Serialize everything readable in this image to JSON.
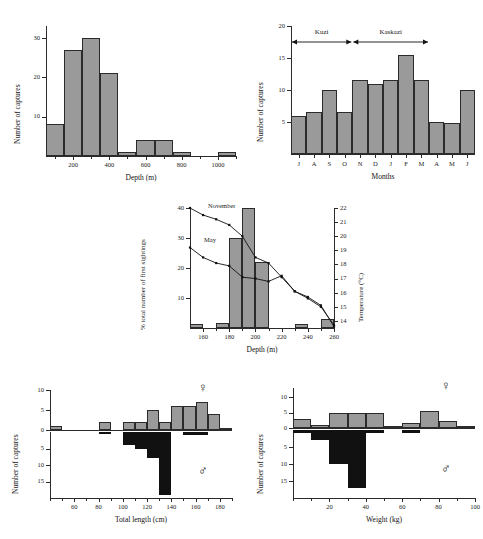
{
  "figure": {
    "panels": [
      "depth-histogram",
      "monthly-captures",
      "first-sightings-temperature",
      "total-length-by-sex",
      "weight-by-sex"
    ],
    "bar_fill": "#9a9a9a",
    "bar_dark_fill": "#111111",
    "axis_color": "#2b2b2b"
  },
  "symbols": {
    "female": "♀",
    "male": "♂"
  },
  "chart_data": [
    {
      "id": "depth-histogram",
      "type": "bar",
      "title": "",
      "xlabel": "Depth (m)",
      "ylabel": "Number of captures",
      "xlim": [
        50,
        1100
      ],
      "ylim": [
        0,
        33
      ],
      "xticks": [
        200,
        400,
        600,
        800,
        1000
      ],
      "xtick_labels": [
        "200",
        "400",
        "600",
        "800",
        "1000"
      ],
      "yticks": [
        10,
        20,
        30
      ],
      "ytick_labels": [
        "10",
        "20",
        "30"
      ],
      "bin_width": 100,
      "bin_starts": [
        50,
        150,
        250,
        350,
        450,
        550,
        650,
        750,
        1000
      ],
      "categories": [
        "50-150",
        "150-250",
        "250-350",
        "350-450",
        "450-550",
        "550-650",
        "650-750",
        "750-850",
        "1000-1100"
      ],
      "values": [
        8,
        27,
        30,
        21,
        1,
        4,
        4,
        1,
        1
      ],
      "grid": false
    },
    {
      "id": "monthly-captures",
      "type": "bar",
      "title": "",
      "xlabel": "Months",
      "ylabel": "Number of captures",
      "categories": [
        "J",
        "A",
        "S",
        "O",
        "N",
        "D",
        "J",
        "F",
        "M",
        "A",
        "M",
        "J"
      ],
      "values": [
        6,
        6.5,
        10,
        6.5,
        11.5,
        11,
        11.5,
        15.5,
        11.5,
        5,
        4.9,
        10
      ],
      "ylim": [
        0,
        20
      ],
      "yticks": [
        5,
        10,
        15,
        20
      ],
      "ytick_labels": [
        "5",
        "10",
        "15",
        "20"
      ],
      "annotations": [
        {
          "label": "Kuzi",
          "from_index": 0,
          "to_index": 3
        },
        {
          "label": "Kaskazi",
          "from_index": 4,
          "to_index": 8
        }
      ],
      "grid": false
    },
    {
      "id": "first-sightings-temperature",
      "type": "bar",
      "xlabel": "Depth (m)",
      "ylabel": "% total number of first sightings",
      "y2label": "Temperature (°C)",
      "xlim": [
        150,
        260
      ],
      "ylim": [
        0,
        40
      ],
      "y2lim": [
        13.5,
        22
      ],
      "xticks": [
        160,
        180,
        200,
        220,
        240,
        260
      ],
      "xtick_labels": [
        "160",
        "180",
        "200",
        "220",
        "240",
        "260"
      ],
      "yticks": [
        10,
        20,
        30,
        40
      ],
      "ytick_labels": [
        "10",
        "20",
        "30",
        "40"
      ],
      "y2ticks": [
        14,
        15,
        16,
        17,
        18,
        19,
        20,
        21,
        22
      ],
      "y2tick_labels": [
        "14",
        "15",
        "16",
        "17",
        "18",
        "19",
        "20",
        "21",
        "22"
      ],
      "bin_width": 10,
      "bin_starts": [
        150,
        170,
        180,
        190,
        200,
        230,
        250
      ],
      "values": [
        1.5,
        1.8,
        30,
        40,
        22,
        1.5,
        3
      ],
      "series": [
        {
          "name": "November",
          "axis": "y2",
          "x": [
            150,
            160,
            170,
            180,
            190,
            200,
            210,
            220,
            230,
            240,
            250,
            260
          ],
          "values": [
            22,
            21.5,
            21.2,
            20.8,
            20,
            18.5,
            18.1,
            17.1,
            16.1,
            15.6,
            15.0,
            13.7
          ]
        },
        {
          "name": "May",
          "axis": "y2",
          "x": [
            150,
            160,
            170,
            180,
            190,
            200,
            210,
            220,
            230,
            240,
            250,
            260
          ],
          "values": [
            19.2,
            18.5,
            18.1,
            17.9,
            17.1,
            17.0,
            16.8,
            17.2,
            16.1,
            15.7,
            15.1,
            13.6
          ]
        }
      ],
      "grid": false
    },
    {
      "id": "total-length-by-sex",
      "type": "bar",
      "xlabel": "Total length (cm)",
      "ylabel": "Number of captures",
      "xlim": [
        40,
        190
      ],
      "xticks": [
        60,
        80,
        100,
        120,
        140,
        160,
        180
      ],
      "xtick_labels": [
        "60",
        "80",
        "100",
        "120",
        "140",
        "160",
        "180"
      ],
      "bin_width": 10,
      "female": {
        "symbol": "♀",
        "ylim": [
          0,
          10
        ],
        "yticks": [
          0,
          5,
          10
        ],
        "ytick_labels": [
          "0",
          "5",
          "10"
        ],
        "bin_starts": [
          40,
          80,
          100,
          110,
          120,
          130,
          140,
          150,
          160,
          170,
          180
        ],
        "values": [
          1,
          2,
          2,
          2,
          5,
          2,
          6,
          6,
          7,
          4,
          0.6
        ]
      },
      "male": {
        "symbol": "♂",
        "ylim": [
          0,
          20
        ],
        "yticks": [
          5,
          10,
          15
        ],
        "ytick_labels": [
          "5",
          "10",
          "15"
        ],
        "bin_starts": [
          80,
          100,
          110,
          120,
          130,
          150,
          160
        ],
        "values": [
          0.5,
          4,
          5,
          8,
          19,
          1,
          1
        ]
      },
      "grid": false
    },
    {
      "id": "weight-by-sex",
      "type": "bar",
      "xlabel": "Weight (kg)",
      "ylabel": "Number of captures",
      "xlim": [
        0,
        100
      ],
      "xticks": [
        20,
        40,
        60,
        80,
        100
      ],
      "xtick_labels": [
        "20",
        "40",
        "60",
        "80",
        "100"
      ],
      "bin_width": 10,
      "female": {
        "symbol": "♀",
        "ylim": [
          0,
          13
        ],
        "yticks": [
          0,
          5,
          10
        ],
        "ytick_labels": [
          "0",
          "5",
          "10"
        ],
        "bin_starts": [
          0,
          10,
          20,
          30,
          40,
          50,
          60,
          70,
          80,
          90
        ],
        "values": [
          3,
          1,
          4.8,
          4.8,
          4.8,
          0.8,
          1.6,
          5.4,
          2.4,
          0.5
        ]
      },
      "male": {
        "symbol": "♂",
        "ylim": [
          0,
          20
        ],
        "yticks": [
          5,
          10,
          15
        ],
        "ytick_labels": [
          "5",
          "10",
          "15"
        ],
        "bin_starts": [
          0,
          10,
          20,
          30,
          40,
          60
        ],
        "values": [
          1,
          3,
          10,
          17,
          1,
          1
        ]
      },
      "grid": false
    }
  ]
}
